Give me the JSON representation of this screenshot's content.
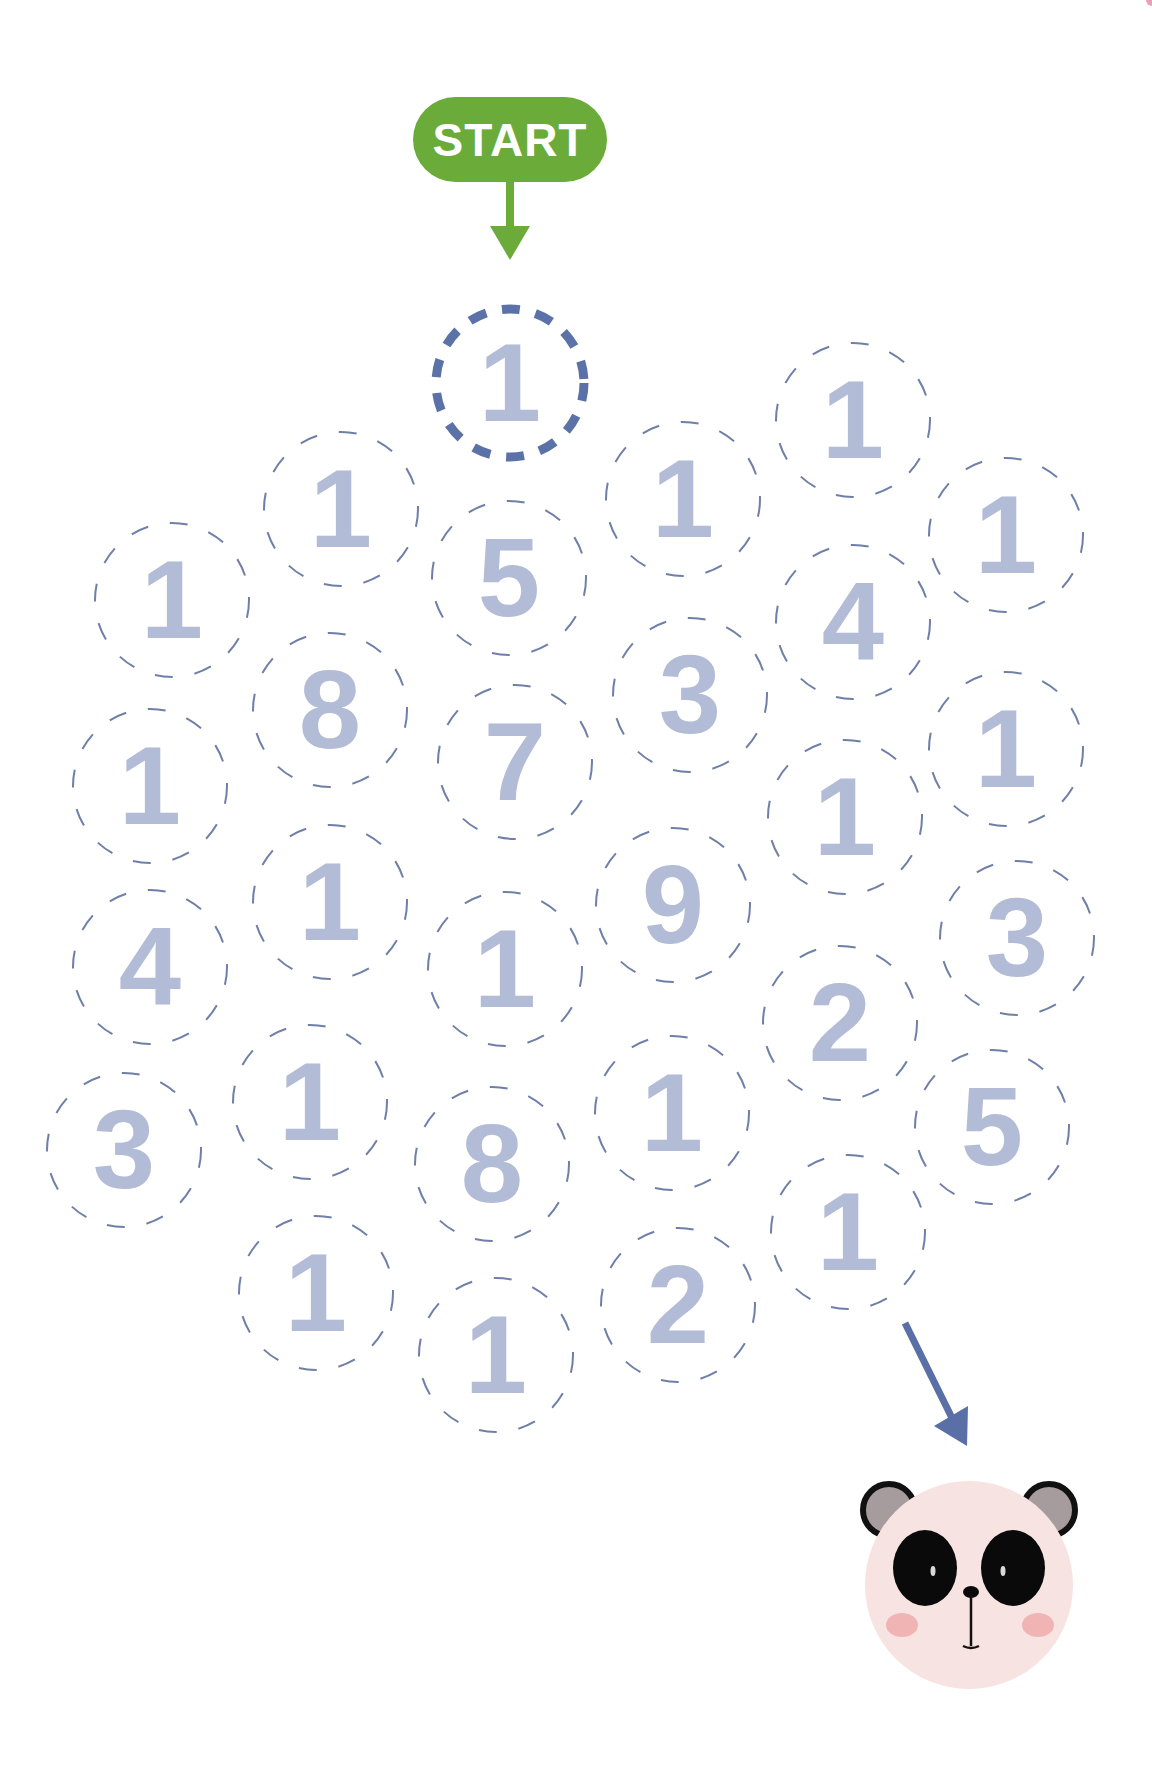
{
  "start": {
    "label": "START",
    "color": "#6aab3a"
  },
  "colors": {
    "digit": "#b3bcd6",
    "dash": "#6f7fa8",
    "start_dash": "#5b72a8",
    "end_arrow": "#5a6fa5",
    "panda_face": "#f7e3e1",
    "panda_ear": "#a69c9e",
    "panda_cheek": "#f0b4b4"
  },
  "cells": [
    {
      "digit": "1",
      "x": 510,
      "y": 383,
      "highlight": true
    },
    {
      "digit": "1",
      "x": 341,
      "y": 509
    },
    {
      "digit": "5",
      "x": 509,
      "y": 578
    },
    {
      "digit": "1",
      "x": 683,
      "y": 499
    },
    {
      "digit": "1",
      "x": 853,
      "y": 420
    },
    {
      "digit": "1",
      "x": 1006,
      "y": 535
    },
    {
      "digit": "1",
      "x": 172,
      "y": 600
    },
    {
      "digit": "8",
      "x": 330,
      "y": 710
    },
    {
      "digit": "7",
      "x": 515,
      "y": 762
    },
    {
      "digit": "3",
      "x": 690,
      "y": 695
    },
    {
      "digit": "4",
      "x": 853,
      "y": 622
    },
    {
      "digit": "1",
      "x": 1006,
      "y": 749
    },
    {
      "digit": "1",
      "x": 150,
      "y": 786
    },
    {
      "digit": "1",
      "x": 330,
      "y": 902
    },
    {
      "digit": "1",
      "x": 505,
      "y": 969
    },
    {
      "digit": "9",
      "x": 673,
      "y": 905
    },
    {
      "digit": "1",
      "x": 845,
      "y": 817
    },
    {
      "digit": "3",
      "x": 1017,
      "y": 938
    },
    {
      "digit": "4",
      "x": 150,
      "y": 967
    },
    {
      "digit": "1",
      "x": 310,
      "y": 1102
    },
    {
      "digit": "8",
      "x": 492,
      "y": 1164
    },
    {
      "digit": "1",
      "x": 672,
      "y": 1113
    },
    {
      "digit": "2",
      "x": 840,
      "y": 1023
    },
    {
      "digit": "5",
      "x": 992,
      "y": 1127
    },
    {
      "digit": "3",
      "x": 124,
      "y": 1150
    },
    {
      "digit": "1",
      "x": 316,
      "y": 1293
    },
    {
      "digit": "1",
      "x": 496,
      "y": 1355
    },
    {
      "digit": "2",
      "x": 678,
      "y": 1305
    },
    {
      "digit": "1",
      "x": 848,
      "y": 1232
    }
  ],
  "goal": {
    "icon": "panda-face-icon",
    "x": 969,
    "y": 1585,
    "r": 104
  }
}
